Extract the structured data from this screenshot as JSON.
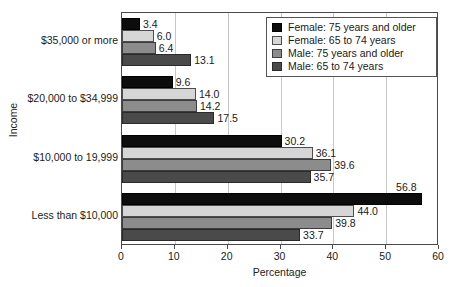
{
  "chart_data": {
    "type": "bar",
    "orientation": "horizontal",
    "title": "",
    "xlabel": "Percentage",
    "ylabel": "Income",
    "xlim": [
      0,
      60
    ],
    "xticks": [
      0,
      10,
      20,
      30,
      40,
      50,
      60
    ],
    "xtick_labels": [
      "0",
      "10",
      "20",
      "30",
      "40",
      "50",
      "60"
    ],
    "grid": "vertical",
    "legend_position": "top-right",
    "categories": [
      "$35,000 or more",
      "$20,000 to $34,999",
      "$10,000 to 19,999",
      "Less than $10,000"
    ],
    "series": [
      {
        "name": "Female: 75 years and older",
        "color": "#0d0d0d",
        "values": [
          3.4,
          9.6,
          30.2,
          56.8
        ],
        "value_labels": [
          "3.4",
          "9.6",
          "30.2",
          "56.8"
        ]
      },
      {
        "name": "Female: 65 to 74 years",
        "color": "#d6d6d6",
        "values": [
          6.0,
          14.0,
          36.1,
          44.0
        ],
        "value_labels": [
          "6.0",
          "14.0",
          "36.1",
          "44.0"
        ]
      },
      {
        "name": "Male: 75 years and older",
        "color": "#8c8c8c",
        "values": [
          6.4,
          14.2,
          39.6,
          39.8
        ],
        "value_labels": [
          "6.4",
          "14.2",
          "39.6",
          "39.8"
        ]
      },
      {
        "name": "Male: 65 to 74 years",
        "color": "#4a4a4a",
        "values": [
          13.1,
          17.5,
          35.7,
          33.7
        ],
        "value_labels": [
          "13.1",
          "17.5",
          "35.7",
          "33.7"
        ]
      }
    ]
  }
}
